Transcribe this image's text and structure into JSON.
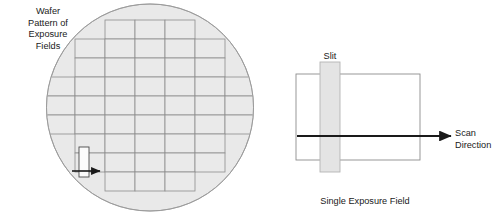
{
  "figure": {
    "background_color": "#ffffff",
    "line_color": "#808080",
    "dark_line_color": "#1a1a1a",
    "wafer_fill": "#e8e8e8",
    "slit_fill": "#e3e3e3",
    "text_color": "#1a1a1a"
  },
  "wafer_panel": {
    "caption_lines": [
      "Wafer",
      "Pattern of",
      "Exposure",
      "Fields"
    ],
    "caption_text": "Wafer Pattern of Exposure Fields",
    "circle": {
      "cx": 150,
      "cy": 107.5,
      "r": 104
    },
    "field_width": 30,
    "field_height": 19,
    "grid_rows": [
      {
        "row": 1,
        "y": 20,
        "x_start": 105,
        "x_end": 195
      },
      {
        "row": 2,
        "y": 39,
        "x_start": 75,
        "x_end": 225
      },
      {
        "row": 3,
        "y": 58,
        "x_start": 75,
        "x_end": 225
      },
      {
        "row": 4,
        "y": 77,
        "x_start": 45,
        "x_end": 255
      },
      {
        "row": 5,
        "y": 96,
        "x_start": 45,
        "x_end": 255
      },
      {
        "row": 6,
        "y": 115,
        "x_start": 45,
        "x_end": 255
      },
      {
        "row": 7,
        "y": 134,
        "x_start": 75,
        "x_end": 225
      },
      {
        "row": 8,
        "y": 153,
        "x_start": 75,
        "x_end": 225
      },
      {
        "row": 9,
        "y": 172,
        "x_start": 105,
        "x_end": 195
      }
    ],
    "marker_slit": {
      "x": 79,
      "y": 147,
      "width": 10,
      "height": 30
    },
    "marker_arrow": {
      "x1": 72,
      "y1": 171,
      "x2": 101,
      "y2": 171,
      "direction": "right"
    }
  },
  "exposure_panel": {
    "slit_label": "Slit",
    "scan_label_lines": [
      "Scan",
      "Direction"
    ],
    "scan_label_text": "Scan Direction",
    "field_caption": "Single Exposure Field",
    "field_rect": {
      "x": 296,
      "y": 74,
      "width": 124,
      "height": 86
    },
    "slit_rect": {
      "x": 320,
      "y": 62,
      "width": 20,
      "height": 110
    },
    "scan_arrow": {
      "x1": 297,
      "y1": 136,
      "x2": 452,
      "y2": 136,
      "direction": "right"
    }
  }
}
